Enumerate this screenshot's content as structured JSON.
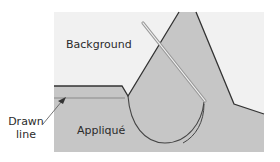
{
  "labels": {
    "background": "Background",
    "applique": "Appliqué",
    "drawn_line_1": "Drawn",
    "drawn_line_2": "line"
  },
  "colors": {
    "background_fabric": "#f1f1f1",
    "applique_fabric": "#c6c6c6",
    "outline": "#333333",
    "drawn_line": "#8a8a8a",
    "needle": "#9a9a9a",
    "thread": "#444444"
  }
}
